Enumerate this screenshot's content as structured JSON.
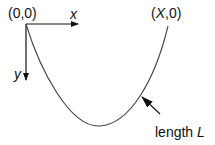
{
  "diagram": {
    "type": "hanging chain / catenary setup",
    "origin_label": "(0,0)",
    "end_label_prefix": "(",
    "end_label_var": "X",
    "end_label_suffix": ",0)",
    "x_axis_label": "x",
    "y_axis_label": "y",
    "length_label_text": "length ",
    "length_label_var": "L",
    "colors": {
      "ink": "#111111",
      "curve": "#444444",
      "background": "#ffffff"
    }
  }
}
